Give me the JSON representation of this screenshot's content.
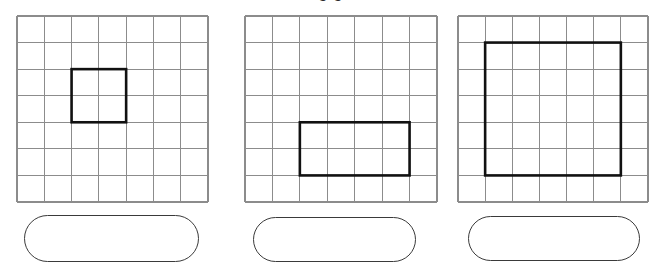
{
  "page": {
    "background_color": "#ffffff",
    "width": 656,
    "height": 272,
    "clipped_header_text": "o o"
  },
  "style": {
    "grid_line_color": "#8c8c8c",
    "grid_border_color": "#8c8c8c",
    "shape_outline_color": "#111111",
    "answer_box_border_color": "#3a3a3a",
    "cell_fill_color": "#ffffff"
  },
  "figures": [
    {
      "id": "figure-1",
      "grid": {
        "columns": 7,
        "rows": 7,
        "left": 17,
        "top": 16,
        "width": 191,
        "height": 186
      },
      "shape": {
        "type": "rectangle",
        "start_column": 3,
        "start_row": 3,
        "columns_spanned": 2,
        "rows_spanned": 2,
        "area_in_squares": 4
      },
      "answer_box": {
        "left": 24,
        "top": 215,
        "width": 175,
        "height": 47,
        "value": "",
        "placeholder": ""
      }
    },
    {
      "id": "figure-2",
      "grid": {
        "columns": 7,
        "rows": 7,
        "left": 245,
        "top": 16,
        "width": 192,
        "height": 186
      },
      "shape": {
        "type": "rectangle",
        "start_column": 3,
        "start_row": 5,
        "columns_spanned": 4,
        "rows_spanned": 2,
        "area_in_squares": 8
      },
      "answer_box": {
        "left": 253,
        "top": 217,
        "width": 163,
        "height": 45,
        "value": "",
        "placeholder": ""
      }
    },
    {
      "id": "figure-3",
      "grid": {
        "columns": 7,
        "rows": 7,
        "left": 458,
        "top": 16,
        "width": 190,
        "height": 186
      },
      "shape": {
        "type": "rectangle",
        "start_column": 2,
        "start_row": 2,
        "columns_spanned": 5,
        "rows_spanned": 5,
        "area_in_squares": 25
      },
      "answer_box": {
        "left": 468,
        "top": 216,
        "width": 172,
        "height": 45,
        "value": "",
        "placeholder": ""
      }
    }
  ]
}
